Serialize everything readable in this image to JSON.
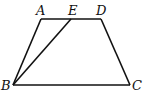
{
  "figure": {
    "type": "trapezoid",
    "points": {
      "A": {
        "label": "A",
        "x": 41,
        "y": 19,
        "lx": 36,
        "ly": 15
      },
      "E": {
        "label": "E",
        "x": 71,
        "y": 19,
        "lx": 68,
        "ly": 15
      },
      "D": {
        "label": "D",
        "x": 101,
        "y": 19,
        "lx": 96,
        "ly": 15
      },
      "B": {
        "label": "B",
        "x": 13,
        "y": 85,
        "lx": 1,
        "ly": 90
      },
      "C": {
        "label": "C",
        "x": 130,
        "y": 85,
        "lx": 132,
        "ly": 90
      }
    },
    "segments": [
      "AD",
      "AB",
      "DC",
      "BC",
      "BE"
    ],
    "stroke_color": "#111111"
  }
}
